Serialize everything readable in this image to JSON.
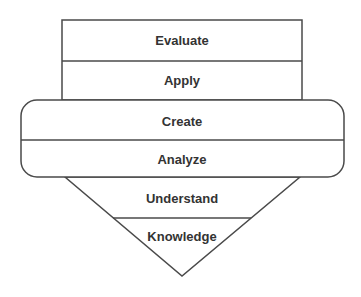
{
  "diagram": {
    "type": "layered-shape",
    "stroke_color": "#4a4a4a",
    "text_color": "#333333",
    "top_box": {
      "layers": [
        {
          "label": "Evaluate"
        },
        {
          "label": "Apply"
        }
      ]
    },
    "middle_rounded_box": {
      "layers": [
        {
          "label": "Create"
        },
        {
          "label": "Analyze"
        }
      ]
    },
    "bottom_triangle": {
      "layers": [
        {
          "label": "Understand"
        },
        {
          "label": "Knowledge"
        }
      ]
    }
  }
}
